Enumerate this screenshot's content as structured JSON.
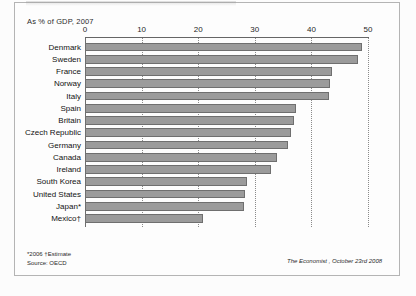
{
  "figure": {
    "subtitle": "As % of GDP, 2007",
    "footnote_line1": "*2006  †Estimate",
    "footnote_line2": "Source: OECD",
    "credit": "The Economist , October 23rd 2008",
    "bar_color": "#9b9b9b",
    "bar_border_color": "#6f6f6f",
    "frame_color": "#b4b4b4",
    "background": "#fdfdfd"
  },
  "chart_data": {
    "type": "bar",
    "orientation": "horizontal",
    "title": "",
    "subtitle": "As % of GDP, 2007",
    "xlabel": "",
    "ylabel": "",
    "xlim": [
      0,
      50
    ],
    "xticks": [
      0,
      10,
      20,
      30,
      40,
      50
    ],
    "xtick_labels": [
      "0",
      "10",
      "20",
      "30",
      "40",
      "50"
    ],
    "grid": "vertical-dotted",
    "legend": "none",
    "source": "OECD",
    "categories": [
      "Denmark",
      "Sweden",
      "France",
      "Norway",
      "Italy",
      "Spain",
      "Britain",
      "Czech Republic",
      "Germany",
      "Canada",
      "Ireland",
      "South Korea",
      "United States",
      "Japan*",
      "Mexico†"
    ],
    "values": [
      49.0,
      48.2,
      43.6,
      43.3,
      43.1,
      37.2,
      36.9,
      36.4,
      35.8,
      33.9,
      32.9,
      28.7,
      28.3,
      28.1,
      20.8
    ],
    "annotations": [
      "* 2006",
      "† Estimate"
    ]
  }
}
